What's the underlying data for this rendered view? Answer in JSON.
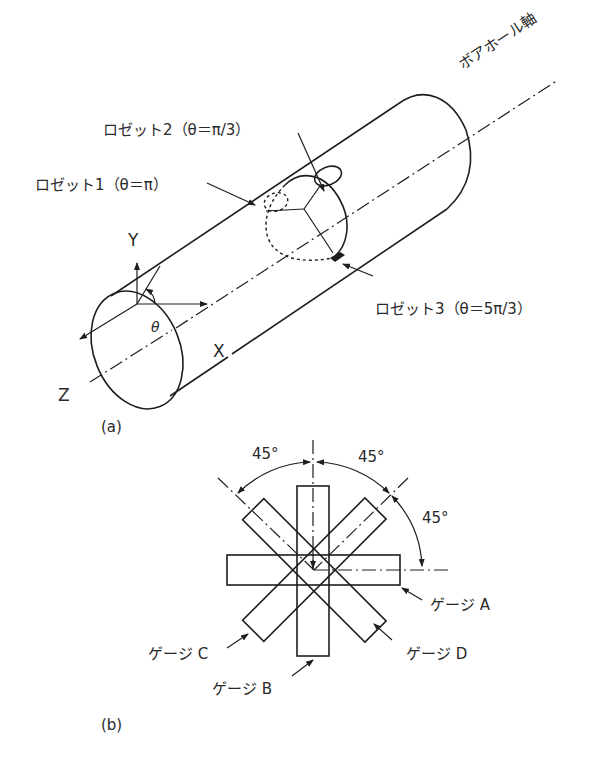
{
  "figure_a": {
    "caption": "(a)",
    "axis_label": "ボアホール軸",
    "axes": {
      "x": "X",
      "y": "Y",
      "z": "Z",
      "angle": "θ"
    },
    "rosettes": [
      {
        "label": "ロゼット1（θ＝π）"
      },
      {
        "label": "ロゼット2（θ＝π/3）"
      },
      {
        "label": "ロゼット3（θ＝5π/3）"
      }
    ]
  },
  "figure_b": {
    "caption": "(b)",
    "angles": [
      "45°",
      "45°",
      "45°"
    ],
    "gauges": [
      {
        "label": "ゲージ A"
      },
      {
        "label": "ゲージ B"
      },
      {
        "label": "ゲージ C"
      },
      {
        "label": "ゲージ D"
      }
    ]
  },
  "colors": {
    "line": "#1e1e1e",
    "text": "#2a2a2a",
    "background": "#ffffff"
  }
}
